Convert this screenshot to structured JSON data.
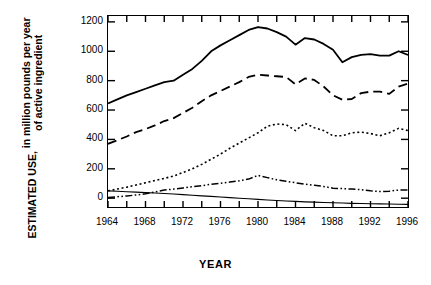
{
  "chart_data": {
    "type": "line",
    "title": "",
    "xlabel": "YEAR",
    "ylabel": "ESTIMATED USE, in million pounds per year of active ingredient",
    "ylabel_line1": "ESTIMATED USE,",
    "ylabel_line2a": "in million pounds per year",
    "ylabel_line2b": "of active ingredient",
    "xlim": [
      1964,
      1996
    ],
    "ylim": [
      -60,
      1240
    ],
    "y_axis_min_label": 0,
    "y_axis_max_label": 1200,
    "grid": false,
    "legend": "none",
    "x_tick_labels": [
      "1964",
      "1968",
      "1972",
      "1976",
      "1980",
      "1984",
      "1988",
      "1992",
      "1996"
    ],
    "x_tick_values": [
      1964,
      1968,
      1972,
      1976,
      1980,
      1984,
      1988,
      1992,
      1996
    ],
    "x_minor_tick_interval": 2,
    "y_tick_labels": [
      "0",
      "200",
      "400",
      "600",
      "800",
      "1000",
      "1200"
    ],
    "y_tick_values": [
      0,
      200,
      400,
      600,
      800,
      1000,
      1200
    ],
    "x": [
      1964,
      1965,
      1966,
      1967,
      1968,
      1969,
      1970,
      1971,
      1972,
      1973,
      1974,
      1975,
      1976,
      1977,
      1978,
      1979,
      1980,
      1981,
      1982,
      1983,
      1984,
      1985,
      1986,
      1987,
      1988,
      1989,
      1990,
      1991,
      1992,
      1993,
      1994,
      1995,
      1996
    ],
    "series": [
      {
        "name": "total",
        "style": "solid",
        "line_width": 1.8,
        "values": [
          645,
          672,
          700,
          722,
          745,
          768,
          790,
          800,
          840,
          880,
          935,
          1000,
          1040,
          1075,
          1110,
          1145,
          1165,
          1155,
          1130,
          1100,
          1045,
          1090,
          1080,
          1050,
          1010,
          925,
          960,
          975,
          980,
          970,
          970,
          1000,
          975
        ]
      },
      {
        "name": "series-2",
        "style": "dashed",
        "line_width": 1.8,
        "values": [
          370,
          395,
          420,
          450,
          470,
          495,
          525,
          545,
          580,
          615,
          660,
          700,
          730,
          760,
          790,
          825,
          840,
          835,
          830,
          825,
          775,
          815,
          805,
          760,
          700,
          670,
          675,
          715,
          725,
          725,
          710,
          760,
          780
        ]
      },
      {
        "name": "series-3",
        "style": "dotted",
        "line_width": 1.6,
        "values": [
          50,
          62,
          75,
          90,
          105,
          120,
          135,
          150,
          175,
          200,
          230,
          265,
          300,
          340,
          375,
          410,
          445,
          490,
          505,
          500,
          460,
          510,
          480,
          460,
          425,
          425,
          445,
          450,
          440,
          425,
          445,
          475,
          460
        ]
      },
      {
        "name": "series-4",
        "style": "dash-dot-dot",
        "line_width": 1.5,
        "values": [
          5,
          10,
          15,
          22,
          30,
          42,
          55,
          62,
          70,
          78,
          85,
          95,
          102,
          110,
          118,
          130,
          155,
          140,
          125,
          115,
          105,
          95,
          88,
          80,
          68,
          65,
          62,
          58,
          50,
          45,
          48,
          55,
          55
        ]
      },
      {
        "name": "series-5",
        "style": "thin-solid",
        "line_width": 1.1,
        "values": [
          50,
          47,
          44,
          41,
          38,
          35,
          32,
          28,
          24,
          20,
          16,
          12,
          8,
          4,
          0,
          -4,
          -8,
          -12,
          -16,
          -19,
          -22,
          -25,
          -27,
          -29,
          -31,
          -33,
          -35,
          -36,
          -38,
          -39,
          -40,
          -41,
          -42
        ]
      }
    ]
  }
}
